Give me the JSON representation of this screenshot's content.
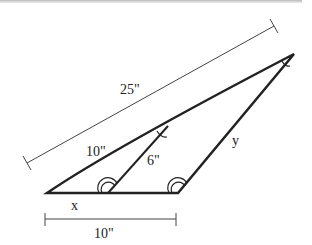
{
  "diagram": {
    "type": "similar triangles",
    "labels": {
      "long_side": "25\"",
      "upper_segment": "10\"",
      "inner_segment": "6\"",
      "right_side": "y",
      "base_segment": "x",
      "base_measure": "10\""
    },
    "colors": {
      "line": "#222222",
      "background": "#ffffff"
    }
  }
}
